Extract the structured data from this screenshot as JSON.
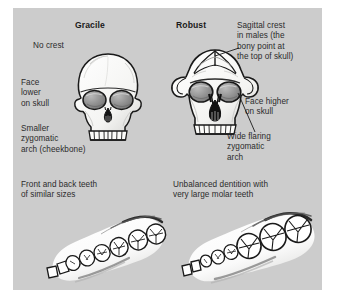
{
  "figure": {
    "panel_background": "#cccccc",
    "page_background": "#ffffff",
    "text_color": "#2b2b2b"
  },
  "columns": {
    "left": {
      "heading": "Gracile",
      "skull_icon": "gracile-skull-front-illustration",
      "jaw_icon": "gracile-upper-jaw-dentition-illustration",
      "annotations": {
        "crest": "No crest",
        "face_position": "Face\nlower\non skull",
        "zygomatic": "Smaller\nzygomatic\narch (cheekbone)",
        "dentition": "Front and back teeth\nof similar sizes"
      }
    },
    "right": {
      "heading": "Robust",
      "skull_icon": "robust-skull-front-illustration",
      "jaw_icon": "robust-upper-jaw-dentition-illustration",
      "annotations": {
        "crest": "Sagittal crest\nin males (the\nbony point at\nthe top of skull)",
        "face_position": "Face higher\non skull",
        "zygomatic": "Wide flaring\nzygomatic\narch",
        "dentition": "Unbalanced dentition with\nvery large molar teeth"
      }
    }
  }
}
